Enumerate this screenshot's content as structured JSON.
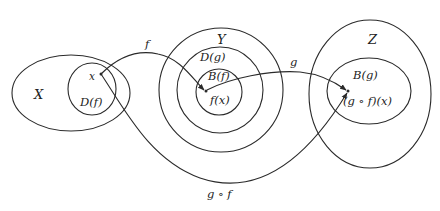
{
  "diagram": {
    "type": "function-composition-sets",
    "sets": {
      "X": {
        "label": "X",
        "subset_label": "D(f)",
        "point_label": "x"
      },
      "Y": {
        "label": "Y",
        "middle_label": "D(g)",
        "inner_label": "B(f)",
        "point_label": "f(x)"
      },
      "Z": {
        "label": "Z",
        "subset_label": "B(g)",
        "point_label": "(g ∘ f)(x)"
      }
    },
    "arrows": {
      "f": {
        "label": "f",
        "from": "x",
        "to": "f(x)"
      },
      "g": {
        "label": "g",
        "from": "f(x)",
        "to": "(g ∘ f)(x)"
      },
      "gf": {
        "label": "g ∘ f",
        "from": "x",
        "to": "(g ∘ f)(x)"
      }
    },
    "colors": {
      "stroke": "#2a2a2a",
      "text": "#222222",
      "background": "#ffffff"
    }
  }
}
